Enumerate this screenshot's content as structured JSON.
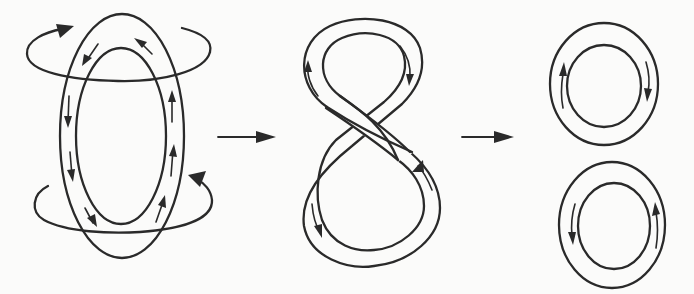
{
  "diagram": {
    "description": "Vortex ring evolution: an elongated ring with circulating flow deforms into a figure-eight and then pinches off into two separate rings",
    "stages": [
      {
        "id": "stage-1",
        "name": "elongated-vortex-ring",
        "shape": "vertical ellipse band",
        "outer": {
          "cx": 122,
          "cy": 136,
          "rx": 62,
          "ry": 122
        },
        "inner": {
          "cx": 121,
          "cy": 136,
          "rx": 45,
          "ry": 88
        },
        "flow_arrows": {
          "left_side": "downward",
          "right_side": "upward",
          "top": "counter-clockwise"
        },
        "rotation_arrows": [
          {
            "position": "top",
            "cx": 118,
            "cy": 52,
            "rx": 92,
            "ry": 28,
            "arrowhead": "top-left, pointing right"
          },
          {
            "position": "bottom",
            "cx": 122,
            "cy": 205,
            "rx": 88,
            "ry": 28,
            "arrowhead": "top-right, pointing up-left"
          }
        ]
      },
      {
        "id": "stage-2",
        "name": "figure-eight-ring",
        "shape": "twisted band forming an 8",
        "bounds": {
          "x": 298,
          "y": 18,
          "w": 143,
          "h": 248
        },
        "flow_arrows": {
          "top_loop": "clockwise (up on left, down on right)",
          "bottom_loop": "counter-clockwise (down on left, up on right)"
        }
      },
      {
        "id": "stage-3",
        "name": "two-separated-rings",
        "rings": [
          {
            "position": "upper",
            "outer": {
              "cx": 604,
              "cy": 84,
              "rx": 54,
              "ry": 61
            },
            "inner": {
              "cx": 604,
              "cy": 86,
              "rx": 37,
              "ry": 41
            },
            "flow": "clockwise"
          },
          {
            "position": "lower",
            "outer": {
              "cx": 612,
              "cy": 225,
              "rx": 53,
              "ry": 63
            },
            "inner": {
              "cx": 614,
              "cy": 226,
              "rx": 36,
              "ry": 43
            },
            "flow": "counter-clockwise"
          }
        ]
      }
    ],
    "transitions": [
      {
        "from": "stage-1",
        "to": "stage-2",
        "x1": 218,
        "x2": 276,
        "y": 137,
        "symbol": "right-arrow"
      },
      {
        "from": "stage-2",
        "to": "stage-3",
        "x1": 462,
        "x2": 514,
        "y": 137,
        "symbol": "right-arrow"
      }
    ],
    "colors": {
      "ink": "#2a2a2a",
      "paper": "#fbfbfa"
    }
  }
}
